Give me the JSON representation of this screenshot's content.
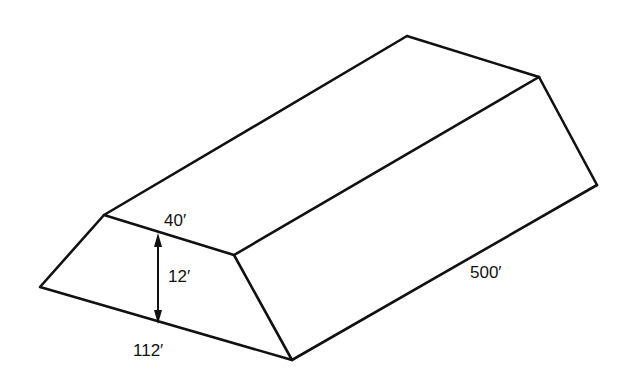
{
  "diagram": {
    "type": "trapezoidal prism (embankment / stockpile)",
    "labels": {
      "top_width": "40′",
      "height": "12′",
      "bottom_width": "112′",
      "length": "500′"
    },
    "colors": {
      "line": "#111111",
      "background": "#ffffff"
    }
  }
}
